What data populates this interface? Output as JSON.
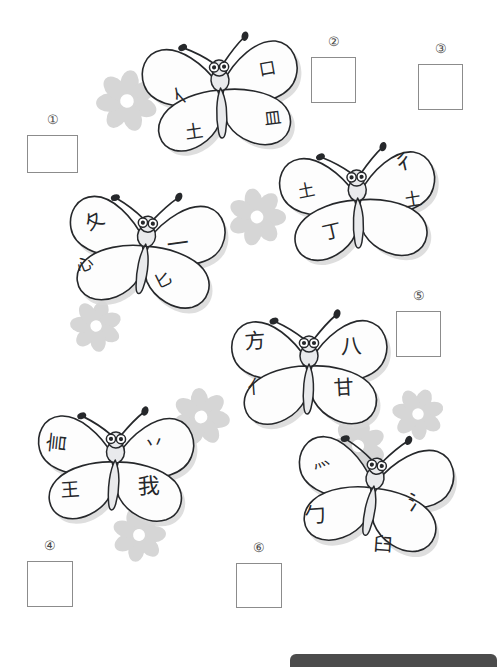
{
  "page": {
    "width": 497,
    "height": 667,
    "background_color": "#ffffff",
    "ink_color": "#26282b",
    "box_border_color": "#8c8c8c",
    "flower_color": "#d6d6d6",
    "footer_bar_color": "#4c4c4c"
  },
  "answer_slots": [
    {
      "label": "①",
      "x": 27,
      "y": 135,
      "w": 51,
      "h": 38,
      "value": ""
    },
    {
      "label": "②",
      "x": 311,
      "y": 57,
      "w": 45,
      "h": 46,
      "value": ""
    },
    {
      "label": "③",
      "x": 418,
      "y": 64,
      "w": 45,
      "h": 46,
      "value": ""
    },
    {
      "label": "④",
      "x": 27,
      "y": 561,
      "w": 46,
      "h": 46,
      "value": ""
    },
    {
      "label": "⑤",
      "x": 396,
      "y": 311,
      "w": 45,
      "h": 46,
      "value": ""
    },
    {
      "label": "⑥",
      "x": 236,
      "y": 563,
      "w": 46,
      "h": 45,
      "value": ""
    }
  ],
  "butterflies": [
    {
      "name": "butterfly-1",
      "x": 131,
      "y": 32,
      "scale": 1.0,
      "rotate": -4,
      "glyphs": [
        {
          "char": "亻",
          "wing": "upper-left",
          "x": 42,
          "y": 50,
          "size": 19,
          "rotate": -38
        },
        {
          "char": "口",
          "wing": "upper-right",
          "x": 130,
          "y": 32,
          "size": 17,
          "rotate": -6
        },
        {
          "char": "土",
          "wing": "lower-left",
          "x": 52,
          "y": 89,
          "size": 18,
          "rotate": -4
        },
        {
          "char": "皿",
          "wing": "lower-right",
          "x": 131,
          "y": 82,
          "size": 17,
          "rotate": -3
        }
      ]
    },
    {
      "name": "butterfly-2",
      "x": 55,
      "y": 188,
      "scale": 1.0,
      "rotate": 6,
      "glyphs": [
        {
          "char": "夂",
          "wing": "upper-left",
          "x": 27,
          "y": 29,
          "size": 19,
          "rotate": -34
        },
        {
          "char": "一",
          "wing": "upper-right",
          "x": 111,
          "y": 42,
          "size": 22,
          "rotate": -14
        },
        {
          "char": "心",
          "wing": "lower-left",
          "x": 23,
          "y": 74,
          "size": 17,
          "rotate": -28
        },
        {
          "char": "匕",
          "wing": "lower-right",
          "x": 103,
          "y": 82,
          "size": 17,
          "rotate": -32
        }
      ]
    },
    {
      "name": "butterfly-3",
      "x": 268,
      "y": 142,
      "scale": 1.0,
      "rotate": -3,
      "glyphs": [
        {
          "char": "土",
          "wing": "upper-left",
          "x": 31,
          "y": 38,
          "size": 17,
          "rotate": -8
        },
        {
          "char": "彳",
          "wing": "upper-right",
          "x": 127,
          "y": 12,
          "size": 21,
          "rotate": -10
        },
        {
          "char": "丁",
          "wing": "lower-left",
          "x": 53,
          "y": 79,
          "size": 19,
          "rotate": -10
        },
        {
          "char": "土",
          "wing": "lower-right",
          "x": 136,
          "y": 52,
          "size": 18,
          "rotate": -6
        }
      ]
    },
    {
      "name": "butterfly-4",
      "x": 219,
      "y": 308,
      "scale": 1.0,
      "rotate": 0,
      "glyphs": [
        {
          "char": "方",
          "wing": "upper-left",
          "x": 26,
          "y": 23,
          "size": 21,
          "rotate": -4
        },
        {
          "char": "八",
          "wing": "upper-right",
          "x": 122,
          "y": 28,
          "size": 21,
          "rotate": -3
        },
        {
          "char": "亻",
          "wing": "lower-left",
          "x": 29,
          "y": 69,
          "size": 19,
          "rotate": -4
        },
        {
          "char": "甘",
          "wing": "lower-right",
          "x": 115,
          "y": 69,
          "size": 20,
          "rotate": -3
        }
      ]
    },
    {
      "name": "butterfly-5",
      "x": 25,
      "y": 404,
      "scale": 1.0,
      "rotate": 2,
      "glyphs": [
        {
          "char": "言",
          "wing": "upper-left",
          "x": 21,
          "y": 30,
          "size": 21,
          "rotate": -86
        },
        {
          "char": "丷",
          "wing": "upper-right",
          "x": 118,
          "y": 28,
          "size": 20,
          "rotate": -8
        },
        {
          "char": "王",
          "wing": "lower-left",
          "x": 36,
          "y": 78,
          "size": 19,
          "rotate": -6
        },
        {
          "char": "我",
          "wing": "lower-right",
          "x": 113,
          "y": 70,
          "size": 22,
          "rotate": -4
        }
      ]
    },
    {
      "name": "butterfly-6",
      "x": 283,
      "y": 430,
      "scale": 1.0,
      "rotate": 8,
      "glyphs": [
        {
          "char": "灬",
          "wing": "upper-left",
          "x": 25,
          "y": 30,
          "size": 17,
          "rotate": -28
        },
        {
          "char": "氵",
          "wing": "upper-right",
          "x": 126,
          "y": 56,
          "size": 21,
          "rotate": -10
        },
        {
          "char": "勹",
          "wing": "lower-left",
          "x": 25,
          "y": 83,
          "size": 21,
          "rotate": -12
        },
        {
          "char": "臼",
          "wing": "lower-right",
          "x": 98,
          "y": 103,
          "size": 19,
          "rotate": -4
        }
      ]
    }
  ],
  "flowers": [
    {
      "name": "flower-1",
      "x": 96,
      "y": 70,
      "size": 62,
      "rotate": 8
    },
    {
      "name": "flower-2",
      "x": 228,
      "y": 188,
      "size": 58,
      "rotate": -12
    },
    {
      "name": "flower-3",
      "x": 70,
      "y": 300,
      "size": 52,
      "rotate": 18
    },
    {
      "name": "flower-4",
      "x": 172,
      "y": 388,
      "size": 58,
      "rotate": -5
    },
    {
      "name": "flower-5",
      "x": 392,
      "y": 388,
      "size": 52,
      "rotate": 22
    },
    {
      "name": "flower-6",
      "x": 112,
      "y": 508,
      "size": 54,
      "rotate": -16
    },
    {
      "name": "flower-7",
      "x": 330,
      "y": 418,
      "size": 56,
      "rotate": 12
    }
  ],
  "footer": {
    "text": ""
  }
}
